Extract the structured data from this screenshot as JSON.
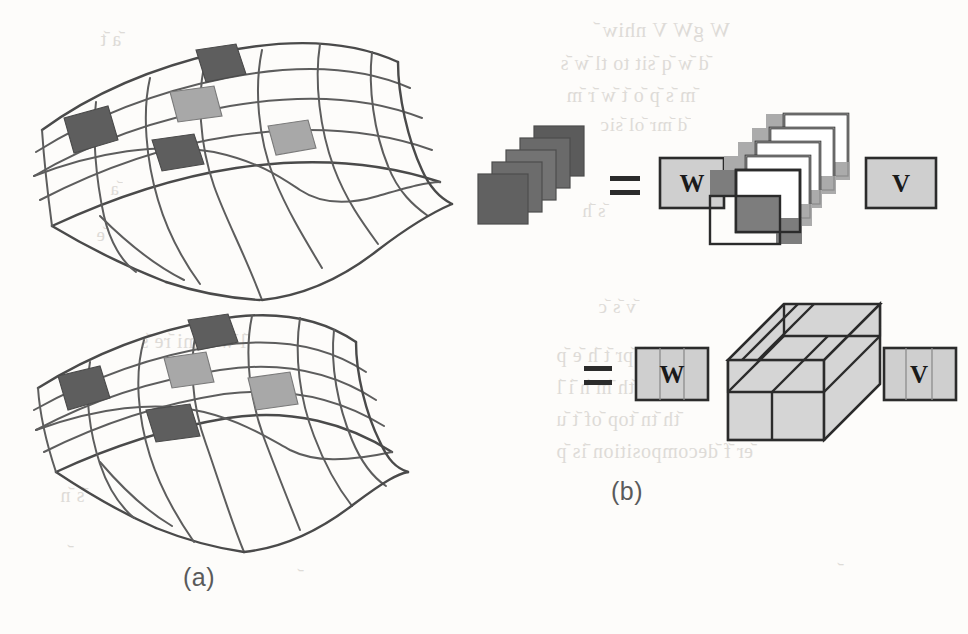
{
  "figure": {
    "panels": [
      {
        "id": "a",
        "label": "(a)",
        "caption_position": "below-left"
      },
      {
        "id": "b",
        "label": "(b)",
        "caption_position": "below-right"
      }
    ]
  },
  "panel_a": {
    "label": "(a)",
    "description": "Two curved quadrilateral mesh surfaces with highlighted shaded patches",
    "surfaces": [
      {
        "name": "upper-mesh-surface",
        "grid_rows": 4,
        "grid_cols": 6,
        "patches": [
          {
            "name": "patch-top",
            "shade": "dark"
          },
          {
            "name": "patch-left",
            "shade": "dark"
          },
          {
            "name": "patch-center",
            "shade": "light"
          },
          {
            "name": "patch-bottom",
            "shade": "dark"
          },
          {
            "name": "patch-right",
            "shade": "light"
          }
        ]
      },
      {
        "name": "lower-mesh-surface",
        "grid_rows": 4,
        "grid_cols": 6,
        "patches": [
          {
            "name": "patch-top",
            "shade": "dark"
          },
          {
            "name": "patch-left",
            "shade": "dark"
          },
          {
            "name": "patch-center",
            "shade": "light"
          },
          {
            "name": "patch-bottom",
            "shade": "dark"
          },
          {
            "name": "patch-right",
            "shade": "light"
          }
        ]
      }
    ]
  },
  "panel_b": {
    "label": "(b)",
    "equations": [
      {
        "name": "matrix-stack-equation",
        "lhs_name": "dark-square-stack",
        "lhs_count": 5,
        "equals": "=",
        "factors": [
          {
            "name": "matrix-w",
            "letter": "W",
            "columns": 1
          },
          {
            "name": "core-frame-stack",
            "letter": "",
            "count": 5
          },
          {
            "name": "matrix-v",
            "letter": "V",
            "columns": 1
          }
        ]
      },
      {
        "name": "tensor-equation",
        "equals": "=",
        "factors": [
          {
            "name": "matrix-w",
            "letter": "W",
            "columns": 3
          },
          {
            "name": "core-tensor-box",
            "letter": ""
          },
          {
            "name": "matrix-v",
            "letter": "V",
            "columns": 3
          }
        ]
      }
    ]
  },
  "colors": {
    "page_background": "#fdfcfa",
    "ink": "#2b2b2b",
    "mesh_stroke": "#5d5d5d",
    "patch_dark": "#5e5e5e",
    "patch_mid": "#8f8f8f",
    "patch_light": "#a8a8a8",
    "matrix_fill": "#cfcfcf",
    "bleed_text": "#d9d6d2"
  },
  "bleed_text": {
    "note": "faint show-through text from reverse of scanned page",
    "lines": [
      {
        "text": "W   V",
        "x": 700,
        "y": 26
      },
      {
        "text": "with",
        "x": 632,
        "y": 50
      },
      {
        "text": "are the",
        "x": 640,
        "y": 82
      },
      {
        "text": "and",
        "x": 610,
        "y": 112
      },
      {
        "text": "where",
        "x": 180,
        "y": 58
      },
      {
        "text": "is a",
        "x": 330,
        "y": 96
      },
      {
        "text": "to",
        "x": 250,
        "y": 132
      }
    ]
  }
}
